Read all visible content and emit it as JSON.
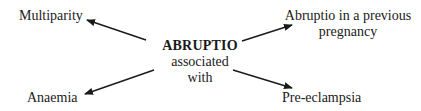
{
  "diagram": {
    "center": {
      "title": "ABRUPTIO",
      "line2": "associated",
      "line3": "with"
    },
    "nodes": [
      {
        "id": "multiparity",
        "label": "Multiparity"
      },
      {
        "id": "previous",
        "label_line1": "Abruptio in a previous",
        "label_line2": "pregnancy"
      },
      {
        "id": "anaemia",
        "label": "Anaemia"
      },
      {
        "id": "preeclampsia",
        "label": "Pre-eclampsia"
      }
    ],
    "edges": [
      {
        "from": "center",
        "to": "multiparity"
      },
      {
        "from": "center",
        "to": "previous"
      },
      {
        "from": "center",
        "to": "anaemia"
      },
      {
        "from": "center",
        "to": "preeclampsia"
      }
    ],
    "colors": {
      "ink": "#1a1a1a",
      "background": "#ffffff"
    }
  }
}
